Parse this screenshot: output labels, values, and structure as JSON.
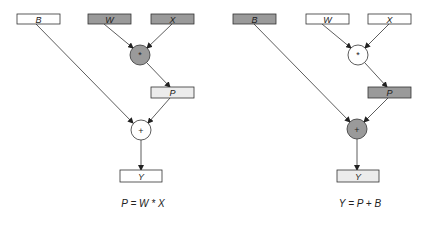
{
  "colors": {
    "white": "#ffffff",
    "dark": "#9a9a9a",
    "light": "#ececec",
    "stroke": "#333333"
  },
  "diagrams": [
    {
      "caption": "P = W * X",
      "nodes": {
        "B": {
          "label": "B",
          "fill": "white"
        },
        "W": {
          "label": "W",
          "fill": "dark"
        },
        "X": {
          "label": "X",
          "fill": "dark"
        },
        "mul": {
          "label": "*",
          "fill": "dark"
        },
        "P": {
          "label": "P",
          "fill": "light"
        },
        "add": {
          "label": "+",
          "fill": "white"
        },
        "Y": {
          "label": "Y",
          "fill": "white"
        }
      }
    },
    {
      "caption": "Y = P + B",
      "nodes": {
        "B": {
          "label": "B",
          "fill": "dark"
        },
        "W": {
          "label": "W",
          "fill": "white"
        },
        "X": {
          "label": "X",
          "fill": "white"
        },
        "mul": {
          "label": "*",
          "fill": "white"
        },
        "P": {
          "label": "P",
          "fill": "dark"
        },
        "add": {
          "label": "+",
          "fill": "dark"
        },
        "Y": {
          "label": "Y",
          "fill": "light"
        }
      }
    }
  ]
}
